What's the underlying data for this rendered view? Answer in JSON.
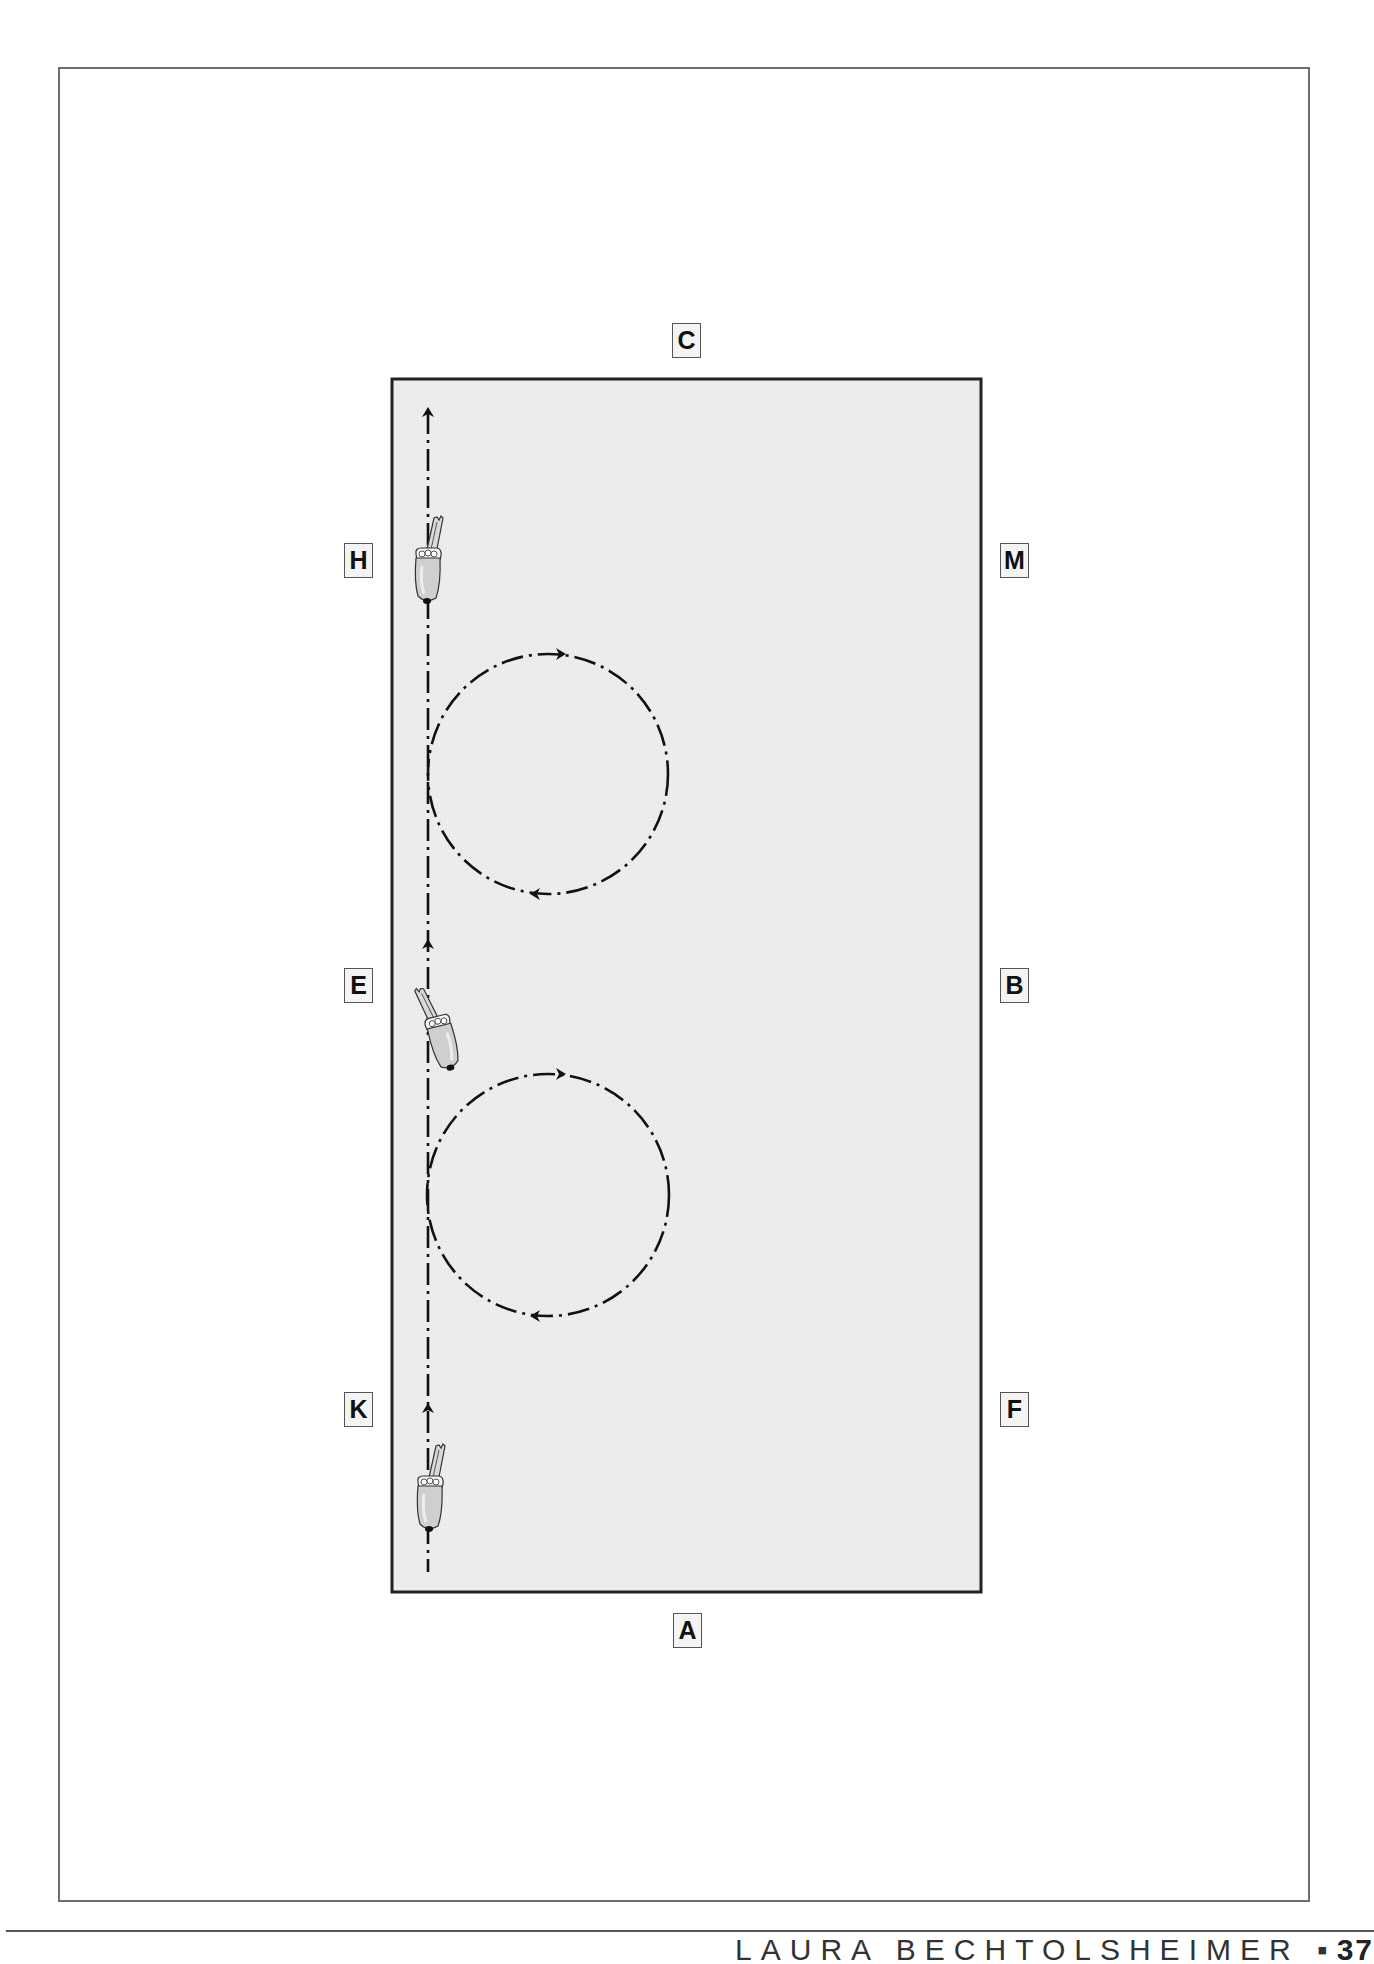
{
  "diagram": {
    "type": "dressage-arena-exercise",
    "arena": {
      "fill": "#ebebeb",
      "stroke": "#222222"
    },
    "markers": [
      {
        "id": "C",
        "label": "C",
        "x": 672,
        "y": 323
      },
      {
        "id": "H",
        "label": "H",
        "x": 344,
        "y": 543
      },
      {
        "id": "M",
        "label": "M",
        "x": 1000,
        "y": 543
      },
      {
        "id": "E",
        "label": "E",
        "x": 344,
        "y": 968
      },
      {
        "id": "B",
        "label": "B",
        "x": 1000,
        "y": 968
      },
      {
        "id": "K",
        "label": "K",
        "x": 344,
        "y": 1392
      },
      {
        "id": "F",
        "label": "F",
        "x": 1000,
        "y": 1392
      },
      {
        "id": "A",
        "label": "A",
        "x": 673,
        "y": 1613
      }
    ],
    "track": {
      "description": "Rider travels up the long side K-E-H on the left track",
      "direction": "up"
    },
    "circles": [
      {
        "name": "upper-circle",
        "near": "between H and E",
        "direction": "clockwise"
      },
      {
        "name": "lower-circle",
        "near": "between E and K",
        "direction": "clockwise"
      }
    ],
    "horses": [
      {
        "name": "horse-near-H",
        "position": "H"
      },
      {
        "name": "horse-near-E",
        "position": "E"
      },
      {
        "name": "horse-near-K",
        "position": "K"
      }
    ]
  },
  "footer": {
    "author": "LAURA BECHTOLSHEIMER",
    "separator": "▪",
    "page_number": "37"
  }
}
